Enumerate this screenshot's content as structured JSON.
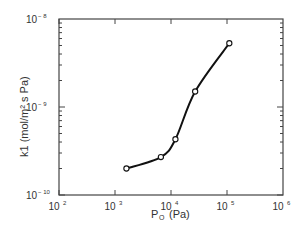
{
  "chart_data": {
    "type": "line",
    "title": "",
    "xlabel": "P_O (Pa)",
    "ylabel": "k1 (mol/m² s Pa)",
    "xscale": "log",
    "yscale": "log",
    "xlim": [
      100,
      1000000
    ],
    "ylim": [
      1e-10,
      1e-08
    ],
    "x_tick_labels": [
      "10²",
      "10³",
      "10⁴",
      "10⁵",
      "10⁶"
    ],
    "y_tick_labels": [
      "10⁻¹⁰",
      "10⁻⁹",
      "10⁻⁸"
    ],
    "grid": false,
    "series": [
      {
        "name": "k1",
        "marker": "open-circle",
        "x": [
          1600,
          6600,
          12000,
          27000,
          110000
        ],
        "values": [
          2e-10,
          2.7e-10,
          4.3e-10,
          1.5e-09,
          5.3e-09
        ]
      }
    ]
  },
  "labels": {
    "x_axis_main": "P",
    "x_axis_sub": "O",
    "x_axis_unit": "(Pa)",
    "y_axis_main": "k",
    "y_axis_sub": "1",
    "y_axis_unit": "(mol/m² s Pa)",
    "x_ticks": [
      {
        "base": "10",
        "exp": "2"
      },
      {
        "base": "10",
        "exp": "3"
      },
      {
        "base": "10",
        "exp": "4"
      },
      {
        "base": "10",
        "exp": "5"
      },
      {
        "base": "10",
        "exp": "6"
      }
    ],
    "y_ticks": [
      {
        "base": "10",
        "exp": "-8"
      },
      {
        "base": "10",
        "exp": "-9"
      },
      {
        "base": "10",
        "exp": "-10"
      }
    ]
  }
}
